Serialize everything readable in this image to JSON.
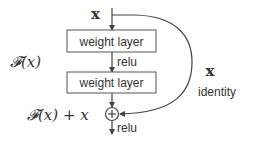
{
  "diagram": {
    "input_label": "x",
    "layers": [
      {
        "label": "weight layer"
      },
      {
        "label": "weight layer"
      }
    ],
    "activation_between": "relu",
    "residual_label": "𝓕(x)",
    "shortcut_label": "x",
    "shortcut_type": "identity",
    "sum_label": "𝓕(x) + x",
    "sum_symbol": "+",
    "output_activation": "relu"
  },
  "colors": {
    "stroke": "#444444",
    "text": "#333333",
    "background": "#ffffff"
  }
}
